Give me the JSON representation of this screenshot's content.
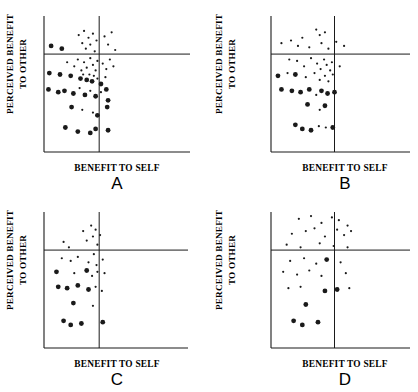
{
  "figure": {
    "width": 418,
    "height": 392,
    "background": "#ffffff",
    "ink_color": "#1a1a1a",
    "panel_count": 4
  },
  "chart_data": [
    {
      "type": "scatter",
      "panel": "A",
      "title": "",
      "xlabel": "BENEFIT TO SELF",
      "ylabel_line1": "PERCEIVED BENEFIT",
      "ylabel_line2": "TO OTHER",
      "xlim": [
        0,
        100
      ],
      "ylim": [
        0,
        100
      ],
      "grid": false,
      "legend": "none",
      "axis_style": "L-frame with extended bottom axis",
      "reference_lines": {
        "horizontal_y": 72,
        "vertical_x": 62,
        "note": "crossing reference lines dividing plot into quadrants"
      },
      "points": [
        {
          "x": 8,
          "y": 78,
          "size": "large"
        },
        {
          "x": 20,
          "y": 76,
          "size": "large"
        },
        {
          "x": 39,
          "y": 86,
          "size": "small"
        },
        {
          "x": 43,
          "y": 80,
          "size": "small"
        },
        {
          "x": 45,
          "y": 89,
          "size": "small"
        },
        {
          "x": 47,
          "y": 76,
          "size": "small"
        },
        {
          "x": 50,
          "y": 84,
          "size": "small"
        },
        {
          "x": 52,
          "y": 79,
          "size": "small"
        },
        {
          "x": 55,
          "y": 87,
          "size": "small"
        },
        {
          "x": 57,
          "y": 74,
          "size": "small"
        },
        {
          "x": 59,
          "y": 82,
          "size": "small"
        },
        {
          "x": 68,
          "y": 85,
          "size": "small"
        },
        {
          "x": 72,
          "y": 79,
          "size": "small"
        },
        {
          "x": 76,
          "y": 88,
          "size": "small"
        },
        {
          "x": 80,
          "y": 75,
          "size": "small"
        },
        {
          "x": 26,
          "y": 66,
          "size": "small"
        },
        {
          "x": 34,
          "y": 63,
          "size": "small"
        },
        {
          "x": 38,
          "y": 68,
          "size": "small"
        },
        {
          "x": 42,
          "y": 60,
          "size": "small"
        },
        {
          "x": 45,
          "y": 66,
          "size": "small"
        },
        {
          "x": 48,
          "y": 62,
          "size": "small"
        },
        {
          "x": 52,
          "y": 69,
          "size": "small"
        },
        {
          "x": 55,
          "y": 64,
          "size": "small"
        },
        {
          "x": 58,
          "y": 60,
          "size": "small"
        },
        {
          "x": 60,
          "y": 67,
          "size": "small"
        },
        {
          "x": 66,
          "y": 65,
          "size": "small"
        },
        {
          "x": 70,
          "y": 61,
          "size": "small"
        },
        {
          "x": 74,
          "y": 68,
          "size": "small"
        },
        {
          "x": 78,
          "y": 63,
          "size": "small"
        },
        {
          "x": 6,
          "y": 58,
          "size": "large"
        },
        {
          "x": 18,
          "y": 57,
          "size": "large"
        },
        {
          "x": 30,
          "y": 56,
          "size": "large"
        },
        {
          "x": 41,
          "y": 54,
          "size": "large"
        },
        {
          "x": 44,
          "y": 57,
          "size": "small"
        },
        {
          "x": 48,
          "y": 53,
          "size": "large"
        },
        {
          "x": 51,
          "y": 57,
          "size": "small"
        },
        {
          "x": 54,
          "y": 52,
          "size": "large"
        },
        {
          "x": 56,
          "y": 56,
          "size": "small"
        },
        {
          "x": 60,
          "y": 54,
          "size": "small"
        },
        {
          "x": 64,
          "y": 50,
          "size": "large"
        },
        {
          "x": 69,
          "y": 55,
          "size": "small"
        },
        {
          "x": 5,
          "y": 46,
          "size": "large"
        },
        {
          "x": 16,
          "y": 44,
          "size": "large"
        },
        {
          "x": 23,
          "y": 45,
          "size": "large"
        },
        {
          "x": 33,
          "y": 43,
          "size": "large"
        },
        {
          "x": 40,
          "y": 47,
          "size": "small"
        },
        {
          "x": 46,
          "y": 42,
          "size": "large"
        },
        {
          "x": 52,
          "y": 45,
          "size": "small"
        },
        {
          "x": 58,
          "y": 41,
          "size": "large"
        },
        {
          "x": 64,
          "y": 44,
          "size": "small"
        },
        {
          "x": 70,
          "y": 46,
          "size": "large"
        },
        {
          "x": 72,
          "y": 38,
          "size": "large"
        },
        {
          "x": 31,
          "y": 33,
          "size": "large"
        },
        {
          "x": 43,
          "y": 31,
          "size": "small"
        },
        {
          "x": 55,
          "y": 29,
          "size": "small"
        },
        {
          "x": 60,
          "y": 27,
          "size": "large"
        },
        {
          "x": 71,
          "y": 33,
          "size": "large"
        },
        {
          "x": 24,
          "y": 18,
          "size": "large"
        },
        {
          "x": 38,
          "y": 15,
          "size": "large"
        },
        {
          "x": 52,
          "y": 14,
          "size": "large"
        },
        {
          "x": 58,
          "y": 17,
          "size": "large"
        },
        {
          "x": 72,
          "y": 16,
          "size": "large"
        }
      ]
    },
    {
      "type": "scatter",
      "panel": "B",
      "title": "",
      "xlabel": "BENEFIT TO SELF",
      "ylabel_line1": "PERCEIVED BENEFIT",
      "ylabel_line2": "TO OTHER",
      "xlim": [
        0,
        100
      ],
      "ylim": [
        0,
        100
      ],
      "grid": false,
      "legend": "none",
      "axis_style": "L-frame with extended bottom axis",
      "reference_lines": {
        "horizontal_y": 72,
        "vertical_x": 73,
        "note": "crossing reference lines dividing plot into quadrants"
      },
      "points": [
        {
          "x": 12,
          "y": 80,
          "size": "small"
        },
        {
          "x": 23,
          "y": 82,
          "size": "small"
        },
        {
          "x": 31,
          "y": 78,
          "size": "small"
        },
        {
          "x": 36,
          "y": 84,
          "size": "small"
        },
        {
          "x": 44,
          "y": 77,
          "size": "small"
        },
        {
          "x": 52,
          "y": 90,
          "size": "small"
        },
        {
          "x": 56,
          "y": 86,
          "size": "small"
        },
        {
          "x": 58,
          "y": 80,
          "size": "small"
        },
        {
          "x": 62,
          "y": 88,
          "size": "small"
        },
        {
          "x": 66,
          "y": 76,
          "size": "small"
        },
        {
          "x": 75,
          "y": 81,
          "size": "small"
        },
        {
          "x": 84,
          "y": 78,
          "size": "small"
        },
        {
          "x": 21,
          "y": 68,
          "size": "small"
        },
        {
          "x": 30,
          "y": 67,
          "size": "small"
        },
        {
          "x": 38,
          "y": 63,
          "size": "small"
        },
        {
          "x": 46,
          "y": 69,
          "size": "small"
        },
        {
          "x": 53,
          "y": 65,
          "size": "small"
        },
        {
          "x": 57,
          "y": 61,
          "size": "small"
        },
        {
          "x": 61,
          "y": 68,
          "size": "small"
        },
        {
          "x": 64,
          "y": 64,
          "size": "small"
        },
        {
          "x": 68,
          "y": 60,
          "size": "small"
        },
        {
          "x": 70,
          "y": 66,
          "size": "small"
        },
        {
          "x": 79,
          "y": 63,
          "size": "small"
        },
        {
          "x": 8,
          "y": 56,
          "size": "large"
        },
        {
          "x": 19,
          "y": 58,
          "size": "small"
        },
        {
          "x": 28,
          "y": 57,
          "size": "large"
        },
        {
          "x": 40,
          "y": 55,
          "size": "small"
        },
        {
          "x": 50,
          "y": 58,
          "size": "small"
        },
        {
          "x": 56,
          "y": 53,
          "size": "small"
        },
        {
          "x": 62,
          "y": 56,
          "size": "small"
        },
        {
          "x": 66,
          "y": 52,
          "size": "small"
        },
        {
          "x": 71,
          "y": 57,
          "size": "small"
        },
        {
          "x": 12,
          "y": 46,
          "size": "large"
        },
        {
          "x": 24,
          "y": 45,
          "size": "large"
        },
        {
          "x": 34,
          "y": 44,
          "size": "large"
        },
        {
          "x": 44,
          "y": 46,
          "size": "large"
        },
        {
          "x": 52,
          "y": 42,
          "size": "small"
        },
        {
          "x": 58,
          "y": 45,
          "size": "large"
        },
        {
          "x": 65,
          "y": 43,
          "size": "large"
        },
        {
          "x": 73,
          "y": 44,
          "size": "large"
        },
        {
          "x": 42,
          "y": 35,
          "size": "large"
        },
        {
          "x": 56,
          "y": 31,
          "size": "small"
        },
        {
          "x": 62,
          "y": 34,
          "size": "large"
        },
        {
          "x": 28,
          "y": 20,
          "size": "large"
        },
        {
          "x": 36,
          "y": 17,
          "size": "large"
        },
        {
          "x": 46,
          "y": 16,
          "size": "large"
        },
        {
          "x": 55,
          "y": 19,
          "size": "small"
        },
        {
          "x": 63,
          "y": 18,
          "size": "small"
        },
        {
          "x": 71,
          "y": 18,
          "size": "large"
        }
      ]
    },
    {
      "type": "scatter",
      "panel": "C",
      "title": "",
      "xlabel": "BENEFIT TO SELF",
      "ylabel_line1": "PERCEIVED BENEFIT",
      "ylabel_line2": "TO OTHER",
      "xlim": [
        0,
        100
      ],
      "ylim": [
        0,
        100
      ],
      "grid": false,
      "legend": "none",
      "axis_style": "L-frame with extended bottom axis",
      "reference_lines": {
        "horizontal_y": 72,
        "vertical_x": 62,
        "note": "crossing reference lines dividing plot into quadrants"
      },
      "points": [
        {
          "x": 22,
          "y": 78,
          "size": "small"
        },
        {
          "x": 28,
          "y": 74,
          "size": "small"
        },
        {
          "x": 44,
          "y": 86,
          "size": "small"
        },
        {
          "x": 48,
          "y": 79,
          "size": "small"
        },
        {
          "x": 53,
          "y": 90,
          "size": "small"
        },
        {
          "x": 55,
          "y": 82,
          "size": "small"
        },
        {
          "x": 58,
          "y": 87,
          "size": "small"
        },
        {
          "x": 60,
          "y": 76,
          "size": "small"
        },
        {
          "x": 63,
          "y": 83,
          "size": "small"
        },
        {
          "x": 20,
          "y": 66,
          "size": "small"
        },
        {
          "x": 30,
          "y": 64,
          "size": "small"
        },
        {
          "x": 38,
          "y": 67,
          "size": "small"
        },
        {
          "x": 50,
          "y": 63,
          "size": "small"
        },
        {
          "x": 56,
          "y": 69,
          "size": "small"
        },
        {
          "x": 59,
          "y": 61,
          "size": "small"
        },
        {
          "x": 66,
          "y": 65,
          "size": "small"
        },
        {
          "x": 14,
          "y": 56,
          "size": "large"
        },
        {
          "x": 34,
          "y": 55,
          "size": "small"
        },
        {
          "x": 48,
          "y": 57,
          "size": "large"
        },
        {
          "x": 54,
          "y": 53,
          "size": "small"
        },
        {
          "x": 60,
          "y": 56,
          "size": "small"
        },
        {
          "x": 68,
          "y": 55,
          "size": "small"
        },
        {
          "x": 16,
          "y": 45,
          "size": "large"
        },
        {
          "x": 26,
          "y": 44,
          "size": "large"
        },
        {
          "x": 38,
          "y": 46,
          "size": "large"
        },
        {
          "x": 50,
          "y": 43,
          "size": "large"
        },
        {
          "x": 58,
          "y": 45,
          "size": "small"
        },
        {
          "x": 65,
          "y": 42,
          "size": "small"
        },
        {
          "x": 33,
          "y": 33,
          "size": "large"
        },
        {
          "x": 55,
          "y": 31,
          "size": "small"
        },
        {
          "x": 22,
          "y": 20,
          "size": "large"
        },
        {
          "x": 30,
          "y": 17,
          "size": "large"
        },
        {
          "x": 42,
          "y": 18,
          "size": "large"
        },
        {
          "x": 66,
          "y": 19,
          "size": "large"
        }
      ]
    },
    {
      "type": "scatter",
      "panel": "D",
      "title": "",
      "xlabel": "BENEFIT TO SELF",
      "ylabel_line1": "PERCEIVED BENEFIT",
      "ylabel_line2": "TO OTHER",
      "xlim": [
        0,
        100
      ],
      "ylim": [
        0,
        100
      ],
      "grid": false,
      "legend": "none",
      "axis_style": "L-frame with extended bottom axis",
      "reference_lines": {
        "horizontal_y": 72,
        "vertical_x": 73,
        "note": "crossing reference lines dividing plot into quadrants"
      },
      "points": [
        {
          "x": 32,
          "y": 95,
          "size": "small"
        },
        {
          "x": 46,
          "y": 97,
          "size": "small"
        },
        {
          "x": 58,
          "y": 92,
          "size": "small"
        },
        {
          "x": 70,
          "y": 96,
          "size": "small"
        },
        {
          "x": 78,
          "y": 94,
          "size": "small"
        },
        {
          "x": 88,
          "y": 90,
          "size": "small"
        },
        {
          "x": 24,
          "y": 84,
          "size": "small"
        },
        {
          "x": 40,
          "y": 86,
          "size": "small"
        },
        {
          "x": 50,
          "y": 88,
          "size": "small"
        },
        {
          "x": 62,
          "y": 82,
          "size": "small"
        },
        {
          "x": 76,
          "y": 87,
          "size": "small"
        },
        {
          "x": 84,
          "y": 83,
          "size": "small"
        },
        {
          "x": 92,
          "y": 86,
          "size": "small"
        },
        {
          "x": 18,
          "y": 76,
          "size": "small"
        },
        {
          "x": 34,
          "y": 74,
          "size": "small"
        },
        {
          "x": 56,
          "y": 77,
          "size": "small"
        },
        {
          "x": 72,
          "y": 75,
          "size": "small"
        },
        {
          "x": 88,
          "y": 74,
          "size": "small"
        },
        {
          "x": 22,
          "y": 64,
          "size": "small"
        },
        {
          "x": 38,
          "y": 66,
          "size": "small"
        },
        {
          "x": 52,
          "y": 62,
          "size": "small"
        },
        {
          "x": 64,
          "y": 65,
          "size": "large"
        },
        {
          "x": 80,
          "y": 63,
          "size": "small"
        },
        {
          "x": 14,
          "y": 56,
          "size": "small"
        },
        {
          "x": 30,
          "y": 54,
          "size": "small"
        },
        {
          "x": 44,
          "y": 57,
          "size": "small"
        },
        {
          "x": 58,
          "y": 53,
          "size": "small"
        },
        {
          "x": 86,
          "y": 55,
          "size": "small"
        },
        {
          "x": 20,
          "y": 44,
          "size": "small"
        },
        {
          "x": 34,
          "y": 45,
          "size": "small"
        },
        {
          "x": 62,
          "y": 42,
          "size": "large"
        },
        {
          "x": 76,
          "y": 43,
          "size": "large"
        },
        {
          "x": 90,
          "y": 44,
          "size": "small"
        },
        {
          "x": 40,
          "y": 32,
          "size": "large"
        },
        {
          "x": 26,
          "y": 20,
          "size": "large"
        },
        {
          "x": 36,
          "y": 17,
          "size": "large"
        },
        {
          "x": 54,
          "y": 19,
          "size": "large"
        }
      ]
    }
  ]
}
